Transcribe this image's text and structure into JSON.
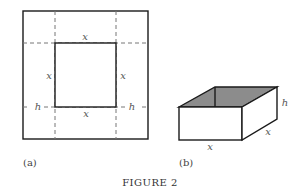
{
  "figure": {
    "caption": "FIGURE 2",
    "panel_a": {
      "label": "(a)",
      "top_side": "x",
      "bottom_side": "x",
      "left_side": "x",
      "right_side": "x",
      "cut_left": "h",
      "cut_right": "h"
    },
    "panel_b": {
      "label": "(b)",
      "height": "h",
      "front_width": "x",
      "depth": "x"
    },
    "colors": {
      "line": "#1a1a1a",
      "dashed": "#777777",
      "box_top_fill": "#8c8c8c"
    }
  }
}
